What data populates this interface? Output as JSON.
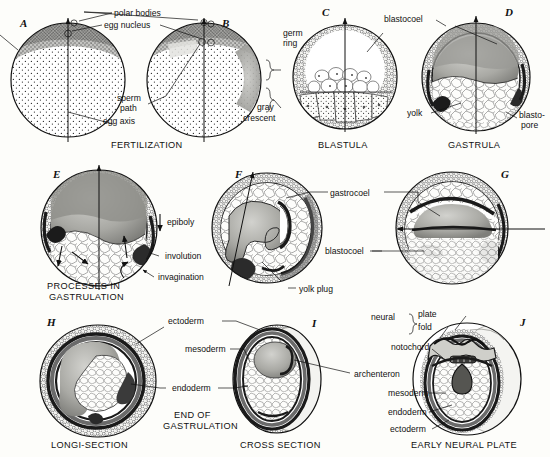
{
  "figure": {
    "background_color": "#fdfdfa",
    "ink_color": "#111111"
  },
  "rows": [
    {
      "name": "row-fertilization-blastula-gastrula",
      "captions": [
        {
          "id": "cap-fertilization",
          "text": "FERTILIZATION"
        },
        {
          "id": "cap-blastula",
          "text": "BLASTULA"
        },
        {
          "id": "cap-gastrula",
          "text": "GASTRULA"
        }
      ]
    },
    {
      "name": "row-processes-in-gastrulation",
      "captions": [
        {
          "id": "cap-processes-1",
          "text": "PROCESSES IN"
        },
        {
          "id": "cap-processes-2",
          "text": "GASTRULATION"
        }
      ]
    },
    {
      "name": "row-end-of-gastrulation-neural-plate",
      "captions": [
        {
          "id": "cap-longi-section",
          "text": "LONGI-SECTION"
        },
        {
          "id": "cap-end-of-1",
          "text": "END OF"
        },
        {
          "id": "cap-end-of-2",
          "text": "GASTRULATION"
        },
        {
          "id": "cap-cross-section",
          "text": "CROSS SECTION"
        },
        {
          "id": "cap-early-neural-plate",
          "text": "EARLY NEURAL PLATE"
        }
      ]
    }
  ],
  "panels": [
    {
      "letter": "A",
      "name": "panel-a-unfertilized-egg",
      "stage": "FERTILIZATION"
    },
    {
      "letter": "B",
      "name": "panel-b-fertilized-egg",
      "stage": "FERTILIZATION"
    },
    {
      "letter": "C",
      "name": "panel-c-blastula",
      "stage": "BLASTULA"
    },
    {
      "letter": "D",
      "name": "panel-d-gastrula",
      "stage": "GASTRULA"
    },
    {
      "letter": "E",
      "name": "panel-e-early-gastrulation",
      "stage": "PROCESSES IN GASTRULATION"
    },
    {
      "letter": "F",
      "name": "panel-f-mid-gastrulation",
      "stage": "PROCESSES IN GASTRULATION"
    },
    {
      "letter": "G",
      "name": "panel-g-late-gastrulation",
      "stage": "PROCESSES IN GASTRULATION"
    },
    {
      "letter": "H",
      "name": "panel-h-longi-section",
      "stage": "END OF GASTRULATION"
    },
    {
      "letter": "I",
      "name": "panel-i-cross-section",
      "stage": "END OF GASTRULATION"
    },
    {
      "letter": "J",
      "name": "panel-j-neural-plate",
      "stage": "EARLY NEURAL PLATE"
    }
  ],
  "labels": {
    "polar_bodies": "polar bodies",
    "egg_nucleus": "egg nucleus",
    "sperm_path_1": "sperm",
    "sperm_path_2": "path",
    "egg_axis": "egg axis",
    "germ_ring_1": "germ",
    "germ_ring_2": "ring",
    "gray_crescent_1": "gray",
    "gray_crescent_2": "crescent",
    "blastocoel_c": "blastocoel",
    "yolk": "yolk",
    "blastopore_1": "blasto-",
    "blastopore_2": "pore",
    "epiboly": "epiboly",
    "involution": "involution",
    "invagination": "invagination",
    "gastrocoel": "gastrocoel",
    "yolk_plug": "yolk plug",
    "blastocoel_g": "blastocoel",
    "ectoderm_h": "ectoderm",
    "mesoderm_i": "mesoderm",
    "endoderm_h": "endoderm",
    "archenteron": "archenteron",
    "neural": "neural",
    "neural_plate": "plate",
    "neural_fold": "fold",
    "notochord": "notochord",
    "mesoderm_j": "mesoderm",
    "endoderm_j": "endoderm",
    "ectoderm_j": "ectoderm"
  }
}
